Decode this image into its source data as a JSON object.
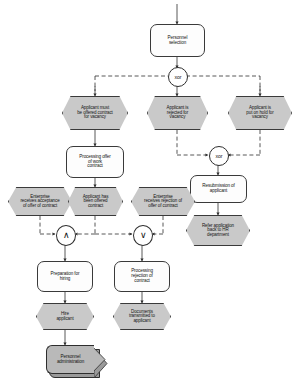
{
  "diagram": {
    "type": "event-driven-process-chain",
    "colors": {
      "event_fill": "#c9c9c9",
      "function_fill": "#fdfdfd",
      "process_fill": "#b9b9b9",
      "stroke": "#3a3a3a",
      "background": "#ffffff"
    },
    "nodes": {
      "personnel_selection": "Personnel\nselection",
      "xor_top": "xor",
      "applicant_must_be_offered": "Applicant must\nbe offered contract\nfor vacancy",
      "applicant_rejected": "Applicant is\nrejected for\nvacancy",
      "applicant_on_hold": "Applicant is\nput on hold for\nvacancy",
      "xor_second": "xor",
      "processing_offer": "Processing offer\nof work\ncontract",
      "resubmission": "Resubmission of\napplicant",
      "enterprise_acceptance": "Enterprise\nreceives acceptance\nof offer of contract",
      "applicant_has_been_offered": "Applicant has\nbeen offered\ncontract",
      "enterprise_rejection": "Enterprise\nreceives rejection of\noffer of contract",
      "refer_application": "Refer application\nback to HR\ndepartment",
      "and_connector": "∧",
      "or_connector": "∨",
      "preparation_hiring": "Preparation for\nhiring",
      "processing_rejection": "Processing\nrejection of\ncontract",
      "hire_applicant": "Hire\napplicant",
      "documents_transmitted": "Documents\ntransmitted to\napplicant",
      "personnel_administration": "Personnel\nadministration"
    }
  }
}
